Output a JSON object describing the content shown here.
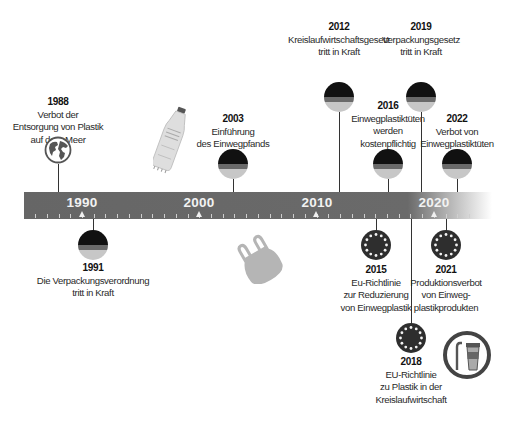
{
  "timeline": {
    "axis_years": [
      "1990",
      "2000",
      "2010",
      "2020"
    ],
    "bar_color": "#666666"
  },
  "events_above": [
    {
      "year": "1988",
      "lines": [
        "Verbot der",
        "Entsorgung von Plastik",
        "auf dem Meer"
      ],
      "icon": "globe-icon"
    },
    {
      "year": "2003",
      "lines": [
        "Einführung",
        "des Einwegpfands"
      ],
      "icon": "german-flag-icon"
    },
    {
      "year": "2012",
      "lines": [
        "Kreislaufwirtschaftsgesetz",
        "tritt in Kraft"
      ],
      "icon": "german-flag-icon"
    },
    {
      "year": "2016",
      "lines": [
        "Einwegplastiktüten",
        "werden",
        "kostenpflichtig"
      ],
      "icon": "german-flag-icon"
    },
    {
      "year": "2019",
      "lines": [
        "Verpackungsgesetz",
        "tritt in Kraft"
      ],
      "icon": "german-flag-icon"
    },
    {
      "year": "2022",
      "lines": [
        "Verbot von",
        "Einwegplastiktüten"
      ],
      "icon": "german-flag-icon"
    }
  ],
  "events_below": [
    {
      "year": "1991",
      "lines": [
        "Die Verpackungsverordnung",
        "tritt in Kraft"
      ],
      "icon": "german-flag-icon"
    },
    {
      "year": "2015",
      "lines": [
        "Eu-Richtlinie",
        "zur Reduzierung",
        "von Einwegplastik"
      ],
      "icon": "eu-flag-icon"
    },
    {
      "year": "2018",
      "lines": [
        "EU-Richtlinie",
        "zu Plastik in der",
        "Kreislaufwirtschaft"
      ],
      "icon": "eu-flag-icon"
    },
    {
      "year": "2021",
      "lines": [
        "Produktionsverbot",
        "von Einweg-",
        "plastikprodukten"
      ],
      "icon": "eu-flag-icon"
    }
  ],
  "decorations": [
    "plastic-bottle-icon",
    "plastic-bag-icon",
    "straw-and-cup-icon"
  ]
}
